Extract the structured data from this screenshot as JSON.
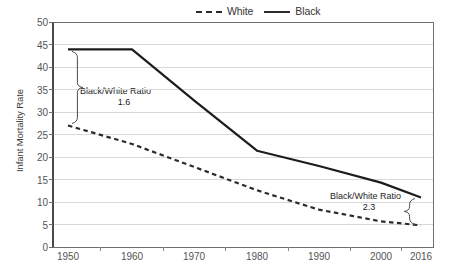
{
  "chart_data": {
    "type": "line",
    "title": "",
    "xlabel": "",
    "ylabel": "Infant Mortality Rate",
    "x": [
      "1950",
      "1960",
      "1970",
      "1980",
      "1990",
      "2000",
      "2016"
    ],
    "xtick_labels": [
      "1950",
      "1960",
      "1970",
      "1980",
      "1990",
      "2000",
      "2016"
    ],
    "ytick_labels": [
      "50",
      "45",
      "40",
      "35",
      "30",
      "25",
      "20",
      "15",
      "10",
      "5",
      "0"
    ],
    "ylim": [
      0,
      50
    ],
    "ytick_step": 5,
    "grid": "horizontal",
    "legend_position": "top-right",
    "series": [
      {
        "name": "White",
        "style": "dashed",
        "color": "#2b2b2b",
        "values": [
          27.0,
          22.9,
          17.8,
          12.6,
          8.3,
          5.7,
          4.8
        ]
      },
      {
        "name": "Black",
        "style": "solid",
        "color": "#1c1c1c",
        "values": [
          43.9,
          43.9,
          32.6,
          21.4,
          18.0,
          14.3,
          11.0
        ]
      }
    ],
    "annotations": [
      {
        "id": "left",
        "title": "Black/White Ratio",
        "value": "1.6",
        "at_x": "1950",
        "brace_from": 43.9,
        "brace_to": 27.0
      },
      {
        "id": "right",
        "title": "Black/White Ratio",
        "value": "2.3",
        "at_x": "2016",
        "brace_from": 11.0,
        "brace_to": 4.8
      }
    ]
  },
  "legend": {
    "entries": [
      {
        "label": "White",
        "style": "dashed"
      },
      {
        "label": "Black",
        "style": "solid"
      }
    ]
  },
  "axis": {
    "y_title": "Infant Mortality Rate",
    "y_labels": [
      "50",
      "45",
      "40",
      "35",
      "30",
      "25",
      "20",
      "15",
      "10",
      "5",
      "0"
    ],
    "x_labels": [
      "1950",
      "1960",
      "1970",
      "1980",
      "1990",
      "2000",
      "2016"
    ]
  },
  "annotations": {
    "left": {
      "title": "Black/White Ratio",
      "value": "1.6"
    },
    "right": {
      "title": "Black/White Ratio",
      "value": "2.3"
    }
  },
  "colors": {
    "line": "#1c1c1c",
    "grid": "#d8d8d8",
    "frame": "#6f6f6f",
    "tick_text": "#555555",
    "axis_title": "#3b3b3b"
  }
}
